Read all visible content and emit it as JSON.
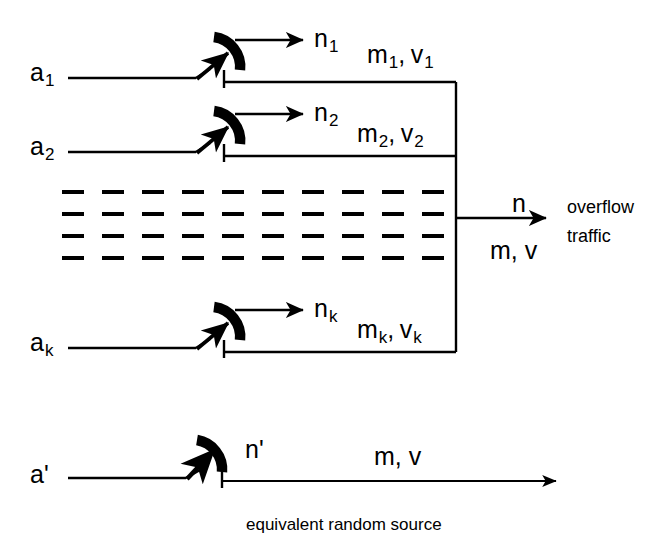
{
  "figure": {
    "type": "traffic-overflow-diagram",
    "caption": "equivalent random source",
    "ink_color": "#000000",
    "background": "#ffffff"
  },
  "sources": [
    {
      "id": "source-1",
      "input_label": "a",
      "input_sub": "1",
      "offered_label": "n",
      "offered_sub": "1",
      "moments_label": "m",
      "moments_sub": "1",
      "variance_label": "v",
      "variance_sub": "1",
      "separator": ","
    },
    {
      "id": "source-2",
      "input_label": "a",
      "input_sub": "2",
      "offered_label": "n",
      "offered_sub": "2",
      "moments_label": "m",
      "moments_sub": "2",
      "variance_label": "v",
      "variance_sub": "2",
      "separator": ","
    },
    {
      "id": "source-k",
      "input_label": "a",
      "input_sub": "k",
      "offered_label": "n",
      "offered_sub": "k",
      "moments_label": "m",
      "moments_sub": "k",
      "variance_label": "v",
      "variance_sub": "k",
      "separator": ","
    }
  ],
  "ellipsis": {
    "rows": 4,
    "columns": 10,
    "note": "dashed continuation rows"
  },
  "output": {
    "count_label": "n",
    "moments_label": "m, v",
    "description_line1": "overflow",
    "description_line2": "traffic"
  },
  "equivalent": {
    "input_label": "a'",
    "offered_label": "n'",
    "moments_label": "m, v"
  }
}
